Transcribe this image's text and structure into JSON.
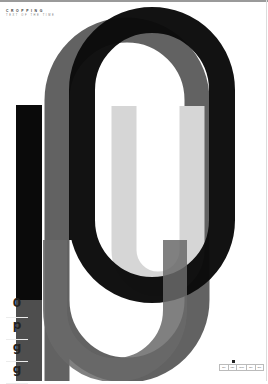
{
  "poster": {
    "brand": "CROPPING",
    "tagline": "TEXT OF THE TIME",
    "colors": {
      "black": "#0a0a0a",
      "dark_gray": "#5a5a5a",
      "mid_gray": "#7a7a7a",
      "light_gray": "#d6d6d6",
      "background": "#ffffff"
    },
    "glyph_samples": [
      "0",
      "p",
      "g",
      "g"
    ],
    "footer_cells": [
      "110",
      "030",
      "0010",
      "110",
      "200"
    ]
  }
}
